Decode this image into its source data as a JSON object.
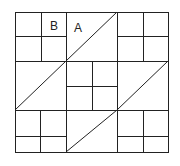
{
  "diagram": {
    "type": "quilt-block",
    "labels": [
      {
        "id": "B",
        "text": "B",
        "x": 51,
        "y": 29
      },
      {
        "id": "A",
        "text": "A",
        "x": 76,
        "y": 31
      }
    ],
    "stroke_color": "#222222",
    "background": "#ffffff"
  }
}
